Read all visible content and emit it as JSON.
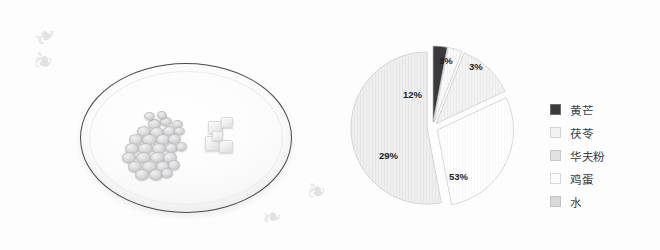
{
  "figure": {
    "photo": {
      "name": "plate-photo",
      "description_items": {
        "plate": "white-oval-plate",
        "cluster": "herb-slices-cluster",
        "cubes": "tofu-cubes"
      },
      "decorations": {
        "flourish_glyph": "❧",
        "flourish_glyph_alt": "❦"
      }
    }
  },
  "chart_data": {
    "type": "pie",
    "title": "",
    "labels": [
      "黄芒",
      "茯苓",
      "华夫粉",
      "鸡蛋",
      "水"
    ],
    "values": [
      3,
      3,
      12,
      29,
      53
    ],
    "value_labels": [
      "3%",
      "3%",
      "12%",
      "29%",
      "53%"
    ],
    "colors": [
      "#3a3a3c",
      "#f4f4f4",
      "#e4e4e4",
      "#fdfdfd",
      "#dcdcdc"
    ],
    "exploded": [
      true,
      true,
      true,
      true,
      true
    ],
    "legend_position": "right",
    "grid": false,
    "start_angle_deg": -90
  },
  "legend": {
    "items": [
      {
        "label": "黄芒",
        "color": "#3a3a3c",
        "value_label": "3%"
      },
      {
        "label": "茯苓",
        "color": "#f2f2f2",
        "value_label": "3%"
      },
      {
        "label": "华夫粉",
        "color": "#e2e2e2",
        "value_label": "12%"
      },
      {
        "label": "鸡蛋",
        "color": "#fdfdfd",
        "value_label": "29%"
      },
      {
        "label": "水",
        "color": "#dadada",
        "value_label": "53%"
      }
    ]
  }
}
